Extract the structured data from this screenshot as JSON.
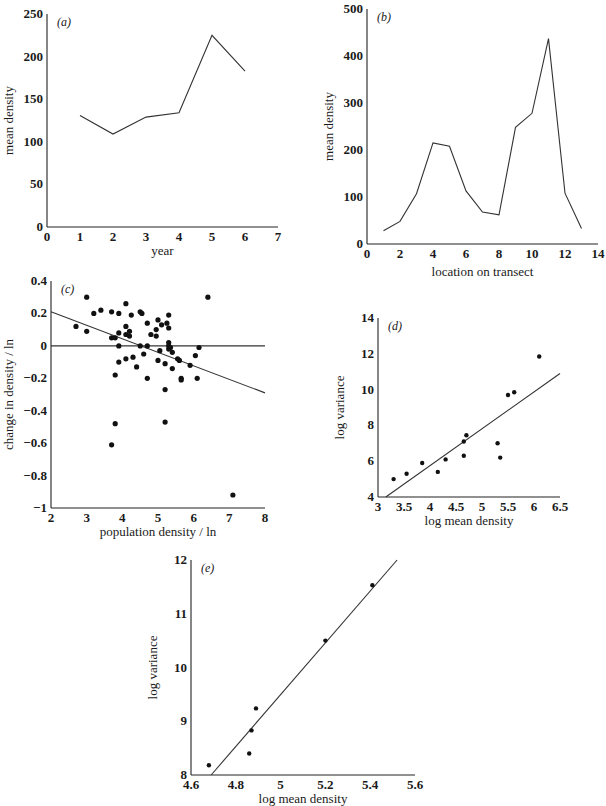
{
  "chart_data": [
    {
      "panel": "(a)",
      "type": "line",
      "xlabel": "year",
      "ylabel": "mean density",
      "xlim": [
        0,
        7
      ],
      "ylim": [
        0,
        250
      ],
      "xticks": [
        0,
        1,
        2,
        3,
        4,
        5,
        6,
        7
      ],
      "yticks": [
        0,
        50,
        100,
        150,
        200,
        250
      ],
      "grid": false,
      "x": [
        1,
        2,
        3,
        4,
        5,
        6
      ],
      "values": [
        131,
        109,
        129,
        134,
        225,
        183
      ]
    },
    {
      "panel": "(b)",
      "type": "line",
      "xlabel": "location on transect",
      "ylabel": "mean density",
      "xlim": [
        0,
        14
      ],
      "ylim": [
        0,
        500
      ],
      "xticks": [
        0,
        2,
        4,
        6,
        8,
        10,
        12,
        14
      ],
      "yticks": [
        0,
        100,
        200,
        300,
        400,
        500
      ],
      "grid": false,
      "x": [
        1,
        2,
        3,
        4,
        5,
        6,
        7,
        8,
        9,
        10,
        11,
        12,
        13
      ],
      "values": [
        28,
        48,
        107,
        215,
        208,
        113,
        68,
        62,
        248,
        278,
        437,
        108,
        33
      ]
    },
    {
      "panel": "(c)",
      "type": "scatter",
      "xlabel": "population density / ln",
      "ylabel": "change in density / ln",
      "xlim": [
        2,
        8
      ],
      "ylim": [
        -1,
        0.4
      ],
      "xticks": [
        2,
        3,
        4,
        5,
        6,
        7,
        8
      ],
      "yticks": [
        "0.4",
        "0.2",
        "0",
        "-0.2",
        "-0.4",
        "-0.6",
        "-0.8",
        "-1"
      ],
      "grid": false,
      "zero_line": true,
      "fit_line": {
        "x": [
          2,
          8
        ],
        "y": [
          0.21,
          -0.29
        ]
      },
      "points": [
        [
          2.7,
          0.12
        ],
        [
          3.0,
          0.3
        ],
        [
          3.0,
          0.09
        ],
        [
          3.2,
          0.2
        ],
        [
          3.4,
          0.22
        ],
        [
          3.7,
          0.21
        ],
        [
          3.7,
          0.05
        ],
        [
          3.8,
          0.05
        ],
        [
          3.8,
          -0.18
        ],
        [
          3.8,
          -0.48
        ],
        [
          3.7,
          -0.61
        ],
        [
          3.9,
          0.2
        ],
        [
          3.9,
          0.08
        ],
        [
          3.9,
          0.0
        ],
        [
          3.9,
          -0.1
        ],
        [
          4.1,
          0.26
        ],
        [
          4.1,
          0.12
        ],
        [
          4.1,
          0.07
        ],
        [
          4.2,
          0.09
        ],
        [
          4.2,
          0.06
        ],
        [
          4.1,
          -0.08
        ],
        [
          4.25,
          0.19
        ],
        [
          4.3,
          -0.07
        ],
        [
          4.4,
          -0.13
        ],
        [
          4.5,
          0.21
        ],
        [
          4.55,
          0.2
        ],
        [
          4.5,
          0.0
        ],
        [
          4.6,
          -0.05
        ],
        [
          4.7,
          0.14
        ],
        [
          4.7,
          0.0
        ],
        [
          4.7,
          -0.2
        ],
        [
          4.8,
          0.07
        ],
        [
          4.95,
          0.1
        ],
        [
          4.95,
          0.06
        ],
        [
          5.0,
          0.16
        ],
        [
          5.0,
          -0.09
        ],
        [
          5.05,
          -0.03
        ],
        [
          5.1,
          0.13
        ],
        [
          5.2,
          -0.11
        ],
        [
          5.2,
          -0.27
        ],
        [
          5.2,
          -0.47
        ],
        [
          5.25,
          0.14
        ],
        [
          5.3,
          0.19
        ],
        [
          5.3,
          0.11
        ],
        [
          5.3,
          0.02
        ],
        [
          5.3,
          0.0
        ],
        [
          5.3,
          -0.02
        ],
        [
          5.35,
          -0.01
        ],
        [
          5.4,
          -0.04
        ],
        [
          5.4,
          -0.14
        ],
        [
          5.55,
          -0.08
        ],
        [
          5.6,
          -0.09
        ],
        [
          5.65,
          -0.2
        ],
        [
          5.65,
          -0.21
        ],
        [
          5.9,
          -0.12
        ],
        [
          6.05,
          -0.06
        ],
        [
          6.1,
          -0.2
        ],
        [
          6.15,
          -0.01
        ],
        [
          6.4,
          0.3
        ],
        [
          7.1,
          -0.92
        ]
      ]
    },
    {
      "panel": "(d)",
      "type": "scatter",
      "xlabel": "log mean density",
      "ylabel": "log variance",
      "xlim": [
        3,
        6.5
      ],
      "ylim": [
        4,
        14
      ],
      "xticks": [
        "3",
        "3.5",
        "4",
        "4.5",
        "5",
        "5.5",
        "6",
        "6.5"
      ],
      "yticks": [
        4,
        6,
        8,
        10,
        12,
        14
      ],
      "grid": false,
      "fit_line": {
        "x": [
          3.15,
          6.5
        ],
        "y": [
          4.0,
          10.9
        ]
      },
      "points": [
        [
          3.3,
          5.0
        ],
        [
          3.55,
          5.3
        ],
        [
          3.85,
          5.9
        ],
        [
          4.15,
          5.4
        ],
        [
          4.3,
          6.1
        ],
        [
          4.65,
          6.3
        ],
        [
          4.65,
          7.1
        ],
        [
          4.7,
          7.45
        ],
        [
          5.3,
          7.0
        ],
        [
          5.35,
          6.2
        ],
        [
          5.5,
          9.7
        ],
        [
          5.62,
          9.85
        ],
        [
          6.1,
          11.85
        ]
      ]
    },
    {
      "panel": "(e)",
      "type": "scatter",
      "xlabel": "log mean density",
      "ylabel": "log variance",
      "xlim": [
        4.6,
        5.6
      ],
      "ylim": [
        8,
        12
      ],
      "xticks": [
        "4.6",
        "4.8",
        "5",
        "5.2",
        "5.4",
        "5.6"
      ],
      "yticks": [
        8,
        9,
        10,
        11,
        12
      ],
      "grid": false,
      "fit_line": {
        "x": [
          4.69,
          5.52
        ],
        "y": [
          8.0,
          12.0
        ]
      },
      "points": [
        [
          4.68,
          8.18
        ],
        [
          4.86,
          8.4
        ],
        [
          4.87,
          8.83
        ],
        [
          4.89,
          9.24
        ],
        [
          5.2,
          10.5
        ],
        [
          5.41,
          11.53
        ]
      ]
    }
  ],
  "layout": [
    {
      "x0": 47,
      "x1": 278,
      "y0": 227,
      "y1": 14
    },
    {
      "x0": 367,
      "x1": 598,
      "y0": 244,
      "y1": 9
    },
    {
      "x0": 51,
      "x1": 265,
      "y0": 508,
      "y1": 281
    },
    {
      "x0": 378,
      "x1": 560,
      "y0": 497,
      "y1": 318
    },
    {
      "x0": 191,
      "x1": 415,
      "y0": 775,
      "y1": 560
    }
  ]
}
